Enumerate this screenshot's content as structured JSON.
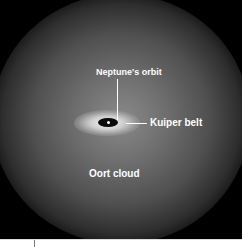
{
  "diagram": {
    "labels": {
      "neptune_orbit": "Neptune's orbit",
      "kuiper_belt": "Kuiper belt",
      "oort_cloud": "Oort cloud"
    },
    "colors": {
      "background": "#000000",
      "cloud": "#6e6e6e",
      "label_text": "#ffffff"
    }
  }
}
